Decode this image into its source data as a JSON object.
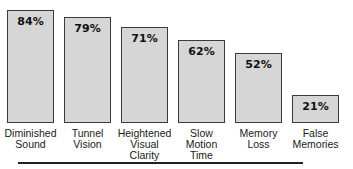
{
  "chart_data": {
    "type": "bar",
    "title": "",
    "xlabel": "",
    "ylabel": "",
    "ylim": [
      0,
      100
    ],
    "grid": false,
    "legend": null,
    "categories": [
      "Diminished Sound",
      "Tunnel Vision",
      "Heightened Visual Clarity",
      "Slow Motion Time",
      "Memory Loss",
      "False Memories"
    ],
    "category_labels_display": [
      "Diminished\nSound",
      "Tunnel\nVision",
      "Heightened\nVisual Clarity",
      "Slow\nMotion\nTime",
      "Memory\nLoss",
      "False\nMemories"
    ],
    "values": [
      84,
      79,
      71,
      62,
      52,
      21
    ],
    "value_labels": [
      "84%",
      "79%",
      "71%",
      "62%",
      "52%",
      "21%"
    ],
    "colors": {
      "bar_fill": "#d6d6d6",
      "bar_border": "#3a3a3a",
      "text": "#111111"
    }
  }
}
